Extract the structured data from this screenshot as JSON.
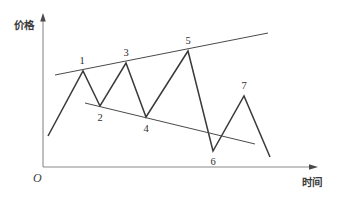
{
  "figure": {
    "title": "",
    "background_color": "#ffffff",
    "axes": {
      "y_axis_label": "价格",
      "x_axis_label": "时间",
      "origin_label": "O",
      "axis_color": "#8a8a8a",
      "y_axis": {
        "x": 43,
        "y_top": 16,
        "y_bottom": 167,
        "arrow": true
      },
      "x_axis": {
        "y": 167,
        "x_left": 43,
        "x_right": 316,
        "arrow": true
      }
    },
    "series_color": "#3a3a3a",
    "trendline_color": "#4a4a4a",
    "point_labels": [
      "1",
      "2",
      "3",
      "4",
      "5",
      "6",
      "7"
    ]
  },
  "chart_data": {
    "type": "line",
    "title": "",
    "xlabel": "时间",
    "ylabel": "价格",
    "grid": false,
    "legend": "none",
    "xlim": [
      43,
      316
    ],
    "ylim": [
      167,
      16
    ],
    "axis_ticks": {
      "x": [],
      "y": []
    },
    "series": [
      {
        "name": "price-zigzag",
        "points": [
          {
            "label": "",
            "x": 48,
            "y": 136
          },
          {
            "label": "1",
            "x": 83,
            "y": 71,
            "kind": "peak"
          },
          {
            "label": "2",
            "x": 100,
            "y": 106,
            "kind": "trough"
          },
          {
            "label": "3",
            "x": 126,
            "y": 63,
            "kind": "peak"
          },
          {
            "label": "4",
            "x": 146,
            "y": 117,
            "kind": "trough"
          },
          {
            "label": "5",
            "x": 188,
            "y": 51,
            "kind": "peak"
          },
          {
            "label": "6",
            "x": 213,
            "y": 151,
            "kind": "trough"
          },
          {
            "label": "7",
            "x": 244,
            "y": 96,
            "kind": "peak"
          },
          {
            "label": "",
            "x": 270,
            "y": 157
          }
        ]
      }
    ],
    "annotations": [
      {
        "name": "upper-trendline",
        "type": "line",
        "description": "rising resistance line through peaks 1, 3, 5",
        "x1": 55,
        "y1": 75,
        "x2": 268,
        "y2": 33
      },
      {
        "name": "lower-trendline",
        "type": "line",
        "description": "falling support line through troughs 2, 4",
        "x1": 85,
        "y1": 103,
        "x2": 255,
        "y2": 144
      }
    ],
    "point_label_positions": [
      {
        "text": "1",
        "x": 82,
        "y": 64
      },
      {
        "text": "2",
        "x": 100,
        "y": 121
      },
      {
        "text": "3",
        "x": 126,
        "y": 56
      },
      {
        "text": "4",
        "x": 146,
        "y": 132
      },
      {
        "text": "5",
        "x": 188,
        "y": 44
      },
      {
        "text": "6",
        "x": 213,
        "y": 165
      },
      {
        "text": "7",
        "x": 244,
        "y": 89
      }
    ]
  }
}
